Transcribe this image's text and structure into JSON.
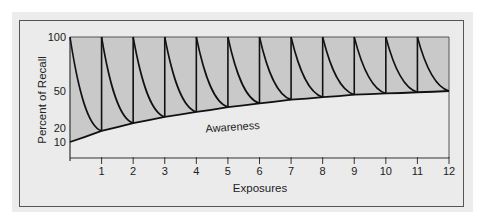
{
  "chart_data": {
    "type": "line",
    "title": "",
    "xlabel": "Exposures",
    "ylabel": "Percent of Recall",
    "x_ticks": [
      "1",
      "2",
      "3",
      "4",
      "5",
      "6",
      "7",
      "8",
      "9",
      "10",
      "11",
      "12"
    ],
    "y_ticks": [
      "100",
      "50",
      "20",
      "10"
    ],
    "xlim": [
      0,
      12
    ],
    "ylim": [
      10,
      100
    ],
    "annotations": [
      {
        "text": "Awareness",
        "x": 4.3,
        "y": 26
      }
    ],
    "series": [
      {
        "name": "Awareness",
        "x": [
          0,
          1,
          2,
          3,
          4,
          5,
          6,
          7,
          8,
          9,
          10,
          11,
          12
        ],
        "values": [
          10,
          18,
          24,
          29,
          33,
          37,
          40,
          43,
          45,
          47,
          48,
          49,
          50
        ]
      },
      {
        "name": "Recall (sawtooth, peaks at each exposure)",
        "peaks_x": [
          0,
          1,
          2,
          3,
          4,
          5,
          6,
          7,
          8,
          9,
          10,
          11
        ],
        "peak_value": 100,
        "troughs_x": [
          1,
          2,
          3,
          4,
          5,
          6,
          7,
          8,
          9,
          10,
          11,
          12
        ],
        "trough_values": [
          18,
          24,
          29,
          33,
          37,
          40,
          43,
          45,
          47,
          48,
          49,
          50
        ]
      }
    ],
    "colors": {
      "fill": "#c9c9c9",
      "line": "#111111",
      "panel": "#ebebeb"
    }
  }
}
